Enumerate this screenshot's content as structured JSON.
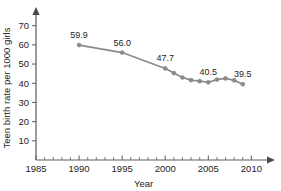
{
  "chart_data": {
    "type": "line",
    "title": "",
    "xlabel": "Year",
    "ylabel": "Teen birth rate per 1000 girls",
    "xlim": [
      1985,
      2011
    ],
    "ylim": [
      0,
      74
    ],
    "grid": false,
    "legend": "none",
    "x_ticks": [
      1985,
      1990,
      1995,
      2000,
      2005,
      2010
    ],
    "x_tick_labels": [
      "1985",
      "1990",
      "1995",
      "2000",
      "2005",
      "2010"
    ],
    "x_minor_step": 1,
    "y_ticks": [
      10,
      20,
      30,
      40,
      50,
      60,
      70
    ],
    "y_tick_labels": [
      "10",
      "20",
      "30",
      "40",
      "50",
      "60",
      "70"
    ],
    "series": [
      {
        "name": "Teen birth rate",
        "color": "#8a8a8a",
        "x": [
          1990,
          1995,
          2000,
          2001,
          2002,
          2003,
          2004,
          2005,
          2006,
          2007,
          2008,
          2009
        ],
        "values": [
          59.9,
          56.0,
          47.7,
          45.3,
          43.0,
          41.6,
          41.1,
          40.5,
          41.9,
          42.5,
          41.5,
          39.5
        ]
      }
    ],
    "annotations": [
      {
        "x": 1990,
        "y": 59.9,
        "text": "59.9"
      },
      {
        "x": 1995,
        "y": 56.0,
        "text": "56.0"
      },
      {
        "x": 2000,
        "y": 47.7,
        "text": "47.7"
      },
      {
        "x": 2005,
        "y": 40.5,
        "text": "40.5"
      },
      {
        "x": 2009,
        "y": 39.5,
        "text": "39.5"
      }
    ]
  }
}
